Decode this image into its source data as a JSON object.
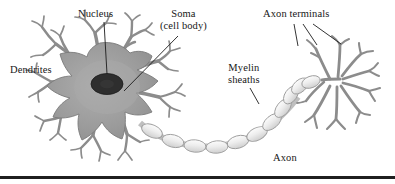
{
  "figure": {
    "name": "neuron-anatomy-diagram",
    "background_color": "#ffffff",
    "bottom_rule_color": "#1f1f1f"
  },
  "labels": {
    "nucleus": "Nucleus",
    "soma_line1": "Soma",
    "soma_line2": "(cell body)",
    "dendrites": "Dendrites",
    "myelin_line1": "Myelin",
    "myelin_line2": "sheaths",
    "axon_terminals": "Axon terminals",
    "axon": "Axon"
  },
  "colors": {
    "soma_fill": "#9a9a9a",
    "soma_inner_fill": "#adadad",
    "nucleus_fill": "#2e2e2e",
    "dendrite_stroke": "#8c8c8c",
    "dendrite_outline": "#5d5d5d",
    "myelin_fill": "#e8e8e8",
    "myelin_stroke": "#9d9d9d",
    "terminal_stroke": "#8c8c8c",
    "leader_line": "#1c1c1c",
    "text": "#171717"
  },
  "structures": {
    "myelin_segment_count": 11,
    "leader_lines": {
      "nucleus": 1,
      "soma": 1,
      "myelin_sheaths": 1,
      "axon_terminals": 3
    }
  }
}
